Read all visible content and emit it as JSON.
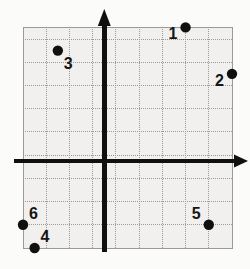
{
  "figure": {
    "type": "coordinate-grid",
    "background_color": "#fbfbfa",
    "grid_fill_color": "#f1f0ee",
    "grid_line_color": "#9a9a96",
    "axis_color": "#101010",
    "point_color": "#101010",
    "label_color": "#151515"
  },
  "chart_data": {
    "type": "scatter",
    "title": "",
    "xlabel": "",
    "ylabel": "",
    "xlim": [
      -3.5,
      5.5
    ],
    "ylim": [
      -3.75,
      5.75
    ],
    "grid": true,
    "grid_step": 1,
    "legend": "none",
    "axes": {
      "x_axis_visible": true,
      "y_axis_visible": true,
      "x_axis_arrow": "right",
      "y_axis_arrow": "up",
      "origin_label": ""
    },
    "points": [
      {
        "label": "1",
        "x": 3.5,
        "y": 5.75,
        "label_position": "left"
      },
      {
        "label": "2",
        "x": 5.5,
        "y": 3.75,
        "label_position": "left"
      },
      {
        "label": "3",
        "x": -2,
        "y": 4.75,
        "label_position": "below-right"
      },
      {
        "label": "4",
        "x": -3,
        "y": -3.75,
        "label_position": "above-right"
      },
      {
        "label": "5",
        "x": 4.5,
        "y": -2.75,
        "label_position": "above-left"
      },
      {
        "label": "6",
        "x": -3.5,
        "y": -2.75,
        "label_position": "above-right"
      }
    ]
  }
}
